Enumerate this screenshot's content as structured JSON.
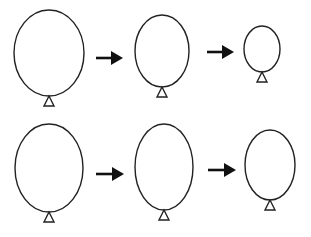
{
  "diagram": {
    "colors": {
      "stroke": "#222222",
      "arrow": "#111111",
      "background": "#ffffff"
    },
    "rows": [
      {
        "name": "row-1-shrinking",
        "balloons": [
          {
            "cx": 49,
            "cy": 53,
            "rx": 35,
            "ry": 43
          },
          {
            "cx": 162,
            "cy": 51,
            "rx": 27,
            "ry": 36
          },
          {
            "cx": 262,
            "cy": 49,
            "rx": 18,
            "ry": 23
          }
        ],
        "arrows": [
          {
            "x1": 96,
            "x2": 123,
            "y": 58
          },
          {
            "x1": 207,
            "x2": 234,
            "y": 52
          }
        ]
      },
      {
        "name": "row-2",
        "balloons": [
          {
            "cx": 49,
            "cy": 168,
            "rx": 34,
            "ry": 44
          },
          {
            "cx": 164,
            "cy": 167,
            "rx": 29,
            "ry": 43
          },
          {
            "cx": 270,
            "cy": 165,
            "rx": 25,
            "ry": 35
          }
        ],
        "arrows": [
          {
            "x1": 96,
            "x2": 124,
            "y": 174
          },
          {
            "x1": 208,
            "x2": 236,
            "y": 170
          }
        ]
      }
    ]
  }
}
